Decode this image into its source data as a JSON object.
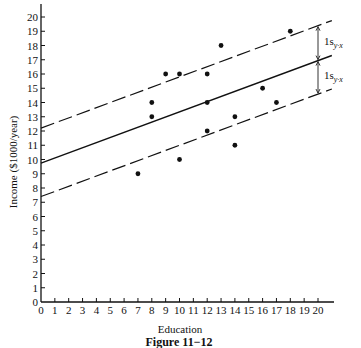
{
  "chart_data": {
    "type": "scatter",
    "title": "",
    "caption": "Figure 11−12",
    "xlabel": "Education",
    "ylabel": "Income ($1000/year)",
    "xlim": [
      0,
      20
    ],
    "ylim": [
      0,
      20
    ],
    "xticks": [
      0,
      1,
      2,
      3,
      4,
      5,
      6,
      7,
      8,
      9,
      10,
      11,
      12,
      13,
      14,
      15,
      16,
      17,
      18,
      19,
      20
    ],
    "yticks": [
      0,
      1,
      2,
      3,
      4,
      5,
      6,
      7,
      8,
      9,
      10,
      11,
      12,
      13,
      14,
      15,
      16,
      17,
      18,
      19,
      20
    ],
    "grid": false,
    "legend": null,
    "points": [
      {
        "x": 7,
        "y": 9
      },
      {
        "x": 8,
        "y": 13
      },
      {
        "x": 8,
        "y": 14
      },
      {
        "x": 9,
        "y": 16
      },
      {
        "x": 10,
        "y": 10
      },
      {
        "x": 10,
        "y": 16
      },
      {
        "x": 12,
        "y": 12
      },
      {
        "x": 12,
        "y": 14
      },
      {
        "x": 12,
        "y": 16
      },
      {
        "x": 13,
        "y": 18
      },
      {
        "x": 14,
        "y": 11
      },
      {
        "x": 14,
        "y": 13
      },
      {
        "x": 16,
        "y": 15
      },
      {
        "x": 17,
        "y": 14
      },
      {
        "x": 18,
        "y": 19
      }
    ],
    "lines": [
      {
        "name": "regression line",
        "style": "solid",
        "x": [
          0,
          21
        ],
        "y": [
          9.75,
          17.3
        ]
      },
      {
        "name": "upper band (+1 s_y.x)",
        "style": "dashed",
        "x": [
          0,
          21
        ],
        "y": [
          12.2,
          19.75
        ]
      },
      {
        "name": "lower band (-1 s_y.x)",
        "style": "dashed",
        "x": [
          0,
          21
        ],
        "y": [
          7.4,
          14.95
        ]
      }
    ],
    "annotations": [
      {
        "text": "1s",
        "sub": "y·x",
        "between": "upper band and regression line",
        "at_x": 20
      },
      {
        "text": "1s",
        "sub": "y·x",
        "between": "regression line and lower band",
        "at_x": 20
      }
    ]
  }
}
